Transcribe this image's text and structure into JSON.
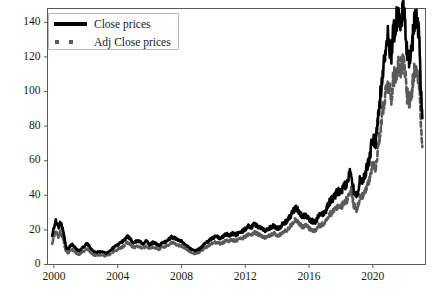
{
  "figure": {
    "background": "#ffffff",
    "width": 434,
    "height": 298
  },
  "legend": {
    "entries": [
      {
        "label": "Close prices",
        "style": "solid-line",
        "color": "#000000"
      },
      {
        "label": "Adj Close prices",
        "style": "dashed-line",
        "color": "#5a5a5a"
      }
    ]
  },
  "axes": {
    "y_ticks": [
      "0",
      "20",
      "40",
      "60",
      "80",
      "100",
      "120",
      "140"
    ],
    "x_ticks": [
      "2000",
      "2004",
      "2008",
      "2012",
      "2016",
      "2020"
    ]
  },
  "chart_data": {
    "type": "line",
    "title": "",
    "xlabel": "",
    "ylabel": "",
    "xlim": [
      1999.6,
      2023.3
    ],
    "ylim": [
      0,
      148
    ],
    "y_ticks": [
      0,
      20,
      40,
      60,
      80,
      100,
      120,
      140
    ],
    "x_ticks": [
      2000,
      2004,
      2008,
      2012,
      2016,
      2020
    ],
    "grid": false,
    "legend_position": "upper-left",
    "x": [
      1999.9,
      2000.0,
      2000.1,
      2000.2,
      2000.3,
      2000.4,
      2000.5,
      2000.6,
      2000.7,
      2000.8,
      2000.9,
      2001.0,
      2001.15,
      2001.3,
      2001.45,
      2001.6,
      2001.75,
      2001.9,
      2002.05,
      2002.2,
      2002.35,
      2002.5,
      2002.65,
      2002.8,
      2002.95,
      2003.1,
      2003.25,
      2003.4,
      2003.55,
      2003.7,
      2003.85,
      2004.0,
      2004.2,
      2004.4,
      2004.6,
      2004.8,
      2005.0,
      2005.2,
      2005.4,
      2005.6,
      2005.8,
      2006.0,
      2006.2,
      2006.4,
      2006.6,
      2006.8,
      2007.0,
      2007.2,
      2007.4,
      2007.6,
      2007.8,
      2008.0,
      2008.2,
      2008.4,
      2008.6,
      2008.8,
      2009.0,
      2009.2,
      2009.4,
      2009.6,
      2009.8,
      2010.0,
      2010.2,
      2010.4,
      2010.6,
      2010.8,
      2011.0,
      2011.2,
      2011.4,
      2011.6,
      2011.8,
      2012.0,
      2012.2,
      2012.4,
      2012.6,
      2012.8,
      2013.0,
      2013.2,
      2013.4,
      2013.6,
      2013.8,
      2014.0,
      2014.2,
      2014.4,
      2014.6,
      2014.8,
      2015.0,
      2015.2,
      2015.4,
      2015.6,
      2015.8,
      2016.0,
      2016.2,
      2016.4,
      2016.6,
      2016.8,
      2017.0,
      2017.2,
      2017.4,
      2017.6,
      2017.8,
      2018.0,
      2018.2,
      2018.4,
      2018.6,
      2018.8,
      2019.0,
      2019.2,
      2019.4,
      2019.6,
      2019.8,
      2020.0,
      2020.15,
      2020.3,
      2020.45,
      2020.6,
      2020.75,
      2020.9,
      2021.0,
      2021.15,
      2021.3,
      2021.45,
      2021.6,
      2021.75,
      2021.9,
      2022.0,
      2022.15,
      2022.3,
      2022.45,
      2022.6,
      2022.75,
      2022.9,
      2023.0,
      2023.1
    ],
    "series": [
      {
        "name": "Close prices",
        "color": "#000000",
        "linestyle": "solid",
        "linewidth": 2.6,
        "values": [
          17.0,
          21.0,
          26.0,
          23.0,
          21.5,
          25.0,
          22.0,
          19.0,
          13.0,
          9.5,
          9.0,
          10.5,
          11.5,
          10.0,
          8.5,
          8.0,
          9.5,
          10.5,
          12.0,
          11.0,
          8.8,
          7.5,
          7.0,
          7.4,
          7.2,
          7.0,
          6.5,
          7.2,
          8.0,
          9.5,
          10.5,
          11.5,
          12.5,
          14.0,
          16.5,
          14.5,
          12.5,
          13.5,
          13.0,
          12.0,
          13.5,
          11.5,
          12.8,
          12.0,
          11.0,
          12.5,
          13.0,
          14.5,
          16.0,
          15.0,
          14.0,
          13.5,
          12.0,
          10.5,
          9.0,
          8.0,
          8.5,
          9.5,
          11.5,
          13.0,
          14.5,
          15.5,
          16.5,
          15.0,
          16.0,
          17.5,
          17.0,
          18.0,
          17.0,
          18.5,
          19.0,
          20.5,
          22.0,
          21.5,
          23.5,
          22.0,
          21.0,
          19.5,
          20.0,
          21.5,
          22.5,
          20.5,
          22.0,
          23.5,
          25.0,
          27.5,
          31.0,
          32.5,
          30.0,
          27.5,
          29.0,
          26.0,
          25.0,
          24.5,
          28.0,
          29.0,
          30.0,
          35.0,
          37.5,
          39.0,
          42.5,
          41.5,
          45.0,
          47.0,
          55.5,
          43.0,
          39.5,
          49.5,
          49.0,
          55.0,
          62.0,
          75.0,
          68.0,
          82.0,
          95.0,
          112.0,
          120.0,
          132.0,
          129.0,
          121.0,
          135.0,
          140.0,
          145.0,
          142.0,
          146.0,
          140.0,
          123.0,
          118.0,
          126.0,
          140.0,
          145.0,
          132.0,
          105.0,
          82.0
        ]
      },
      {
        "name": "Adj Close prices",
        "color": "#5a5a5a",
        "linestyle": "dashed",
        "linewidth": 2.6,
        "values": [
          12.0,
          15.5,
          19.5,
          17.5,
          16.0,
          19.0,
          16.5,
          14.0,
          9.5,
          7.0,
          6.5,
          7.8,
          8.5,
          7.3,
          6.2,
          5.8,
          7.0,
          7.8,
          9.0,
          8.2,
          6.5,
          5.5,
          5.2,
          5.5,
          5.4,
          5.2,
          4.9,
          5.4,
          6.0,
          7.1,
          7.9,
          8.8,
          9.6,
          10.8,
          12.8,
          11.3,
          9.8,
          10.6,
          10.2,
          9.4,
          10.6,
          9.1,
          10.1,
          9.5,
          8.7,
          9.9,
          10.3,
          11.5,
          12.7,
          11.9,
          11.1,
          10.7,
          9.5,
          8.3,
          7.1,
          6.3,
          6.7,
          7.5,
          9.1,
          10.3,
          11.5,
          12.3,
          13.1,
          11.9,
          12.7,
          13.9,
          13.5,
          14.3,
          13.5,
          14.7,
          15.1,
          16.3,
          17.5,
          17.1,
          18.7,
          17.5,
          16.7,
          15.5,
          15.9,
          17.1,
          17.9,
          16.3,
          17.5,
          18.7,
          19.9,
          21.9,
          24.7,
          25.9,
          23.9,
          21.9,
          23.1,
          20.7,
          19.9,
          19.5,
          22.3,
          23.1,
          23.9,
          27.9,
          29.9,
          31.1,
          33.9,
          33.1,
          35.9,
          37.5,
          44.3,
          34.3,
          31.5,
          39.5,
          39.1,
          43.9,
          49.5,
          59.9,
          54.3,
          65.5,
          75.9,
          89.5,
          95.9,
          105.5,
          103.1,
          96.7,
          107.9,
          111.9,
          115.9,
          113.5,
          116.7,
          112.0,
          98.3,
          94.3,
          100.7,
          111.9,
          115.9,
          105.5,
          84.0,
          65.5
        ]
      }
    ]
  }
}
